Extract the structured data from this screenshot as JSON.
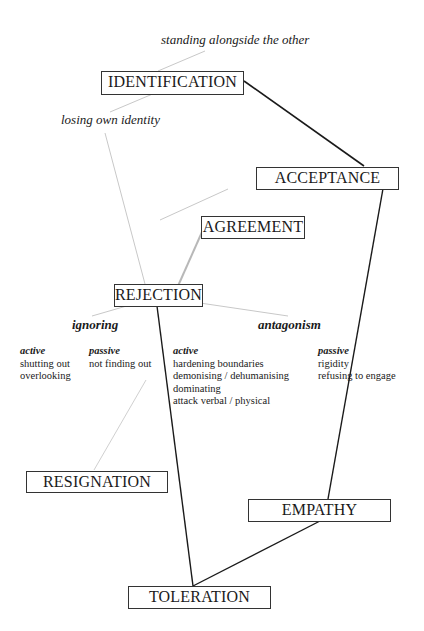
{
  "diagram": {
    "nodes": {
      "identification": "IDENTIFICATION",
      "acceptance": "ACCEPTANCE",
      "agreement": "AGREEMENT",
      "rejection": "REJECTION",
      "resignation": "RESIGNATION",
      "empathy": "EMPATHY",
      "toleration": "TOLERATION"
    },
    "annotations": {
      "standing_alongside": "standing alongside the other",
      "losing_identity": "losing own identity"
    },
    "rejection_branches": {
      "ignoring": {
        "title": "ignoring",
        "active": {
          "label": "active",
          "items": [
            "shutting out",
            "overlooking"
          ]
        },
        "passive": {
          "label": "passive",
          "items": [
            "not finding out"
          ]
        }
      },
      "antagonism": {
        "title": "antagonism",
        "active": {
          "label": "active",
          "items": [
            "hardening boundaries",
            "demonising / dehumanising",
            "dominating",
            "attack verbal / physical"
          ]
        },
        "passive": {
          "label": "passive",
          "items": [
            "rigidity",
            "refusing to engage"
          ]
        }
      }
    },
    "colors": {
      "strong_line": "#1a1a1a",
      "faint_line": "#c8c8c8",
      "box_border": "#333333"
    }
  }
}
